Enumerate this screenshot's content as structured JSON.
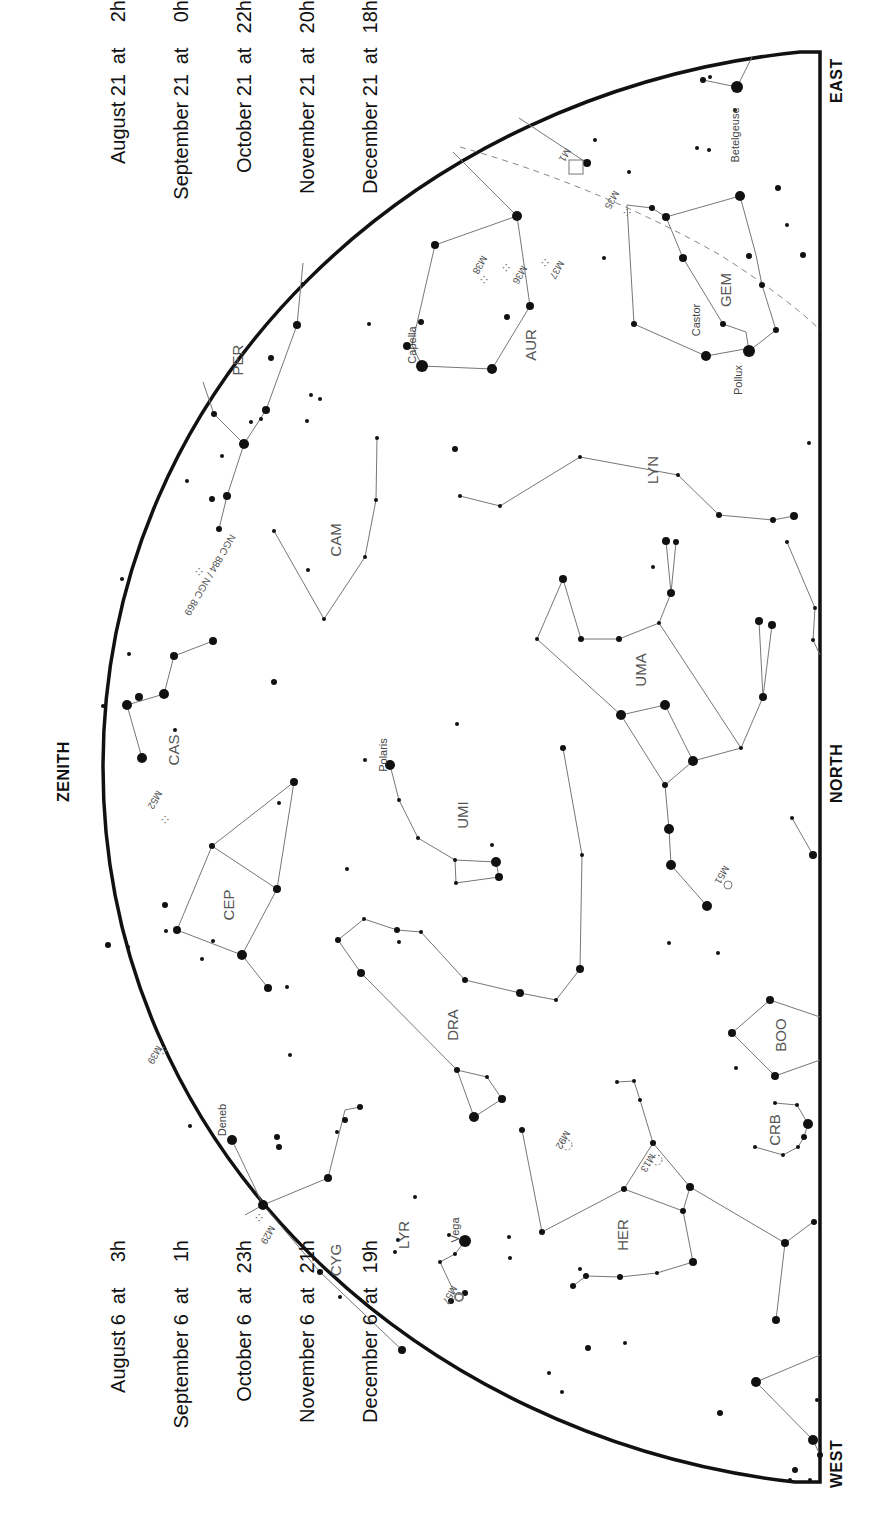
{
  "map": {
    "title_times_top": [
      {
        "date": "August 21",
        "at": "at",
        "hour": "2h"
      },
      {
        "date": "September 21",
        "at": "at",
        "hour": "0h"
      },
      {
        "date": "October 21",
        "at": "at",
        "hour": "22h"
      },
      {
        "date": "November 21",
        "at": "at",
        "hour": "20h"
      },
      {
        "date": "December 21",
        "at": "at",
        "hour": "18h"
      }
    ],
    "title_times_bottom": [
      {
        "date": "August 6",
        "at": "at",
        "hour": "3h"
      },
      {
        "date": "September 6",
        "at": "at",
        "hour": "1h"
      },
      {
        "date": "October 6",
        "at": "at",
        "hour": "23h"
      },
      {
        "date": "November 6",
        "at": "at",
        "hour": "21h"
      },
      {
        "date": "December 6",
        "at": "at",
        "hour": "19h"
      }
    ],
    "directions": {
      "zenith": "ZENITH",
      "north": "NORTH",
      "east": "EAST",
      "west": "WEST"
    },
    "colors": {
      "ink": "#111111",
      "line": "#777777",
      "label": "#555555",
      "ecliptic": "#888888",
      "background": "#ffffff"
    }
  },
  "constellations": [
    {
      "abbr": "PER",
      "x": 237,
      "y": 360
    },
    {
      "abbr": "AUR",
      "x": 530,
      "y": 345
    },
    {
      "abbr": "GEM",
      "x": 725,
      "y": 290
    },
    {
      "abbr": "CAM",
      "x": 335,
      "y": 540
    },
    {
      "abbr": "LYN",
      "x": 652,
      "y": 470
    },
    {
      "abbr": "CAS",
      "x": 173,
      "y": 750
    },
    {
      "abbr": "UMA",
      "x": 640,
      "y": 670
    },
    {
      "abbr": "UMI",
      "x": 462,
      "y": 815
    },
    {
      "abbr": "CEP",
      "x": 228,
      "y": 905
    },
    {
      "abbr": "DRA",
      "x": 452,
      "y": 1025
    },
    {
      "abbr": "BOO",
      "x": 780,
      "y": 1035
    },
    {
      "abbr": "CRB",
      "x": 774,
      "y": 1130
    },
    {
      "abbr": "HER",
      "x": 622,
      "y": 1235
    },
    {
      "abbr": "CYG",
      "x": 335,
      "y": 1260
    },
    {
      "abbr": "LYR",
      "x": 403,
      "y": 1235
    }
  ],
  "star_names": [
    {
      "name": "Betelgeuse",
      "x": 735,
      "y": 135
    },
    {
      "name": "Capella",
      "x": 412,
      "y": 345
    },
    {
      "name": "Castor",
      "x": 696,
      "y": 320
    },
    {
      "name": "Pollux",
      "x": 738,
      "y": 380
    },
    {
      "name": "Polaris",
      "x": 383,
      "y": 755
    },
    {
      "name": "Deneb",
      "x": 222,
      "y": 1120
    },
    {
      "name": "Vega",
      "x": 455,
      "y": 1230
    }
  ],
  "deep_sky_objects": [
    {
      "name": "M1",
      "x": 565,
      "y": 155,
      "type": "nebula"
    },
    {
      "name": "M35",
      "x": 612,
      "y": 200,
      "type": "open-cluster"
    },
    {
      "name": "M36",
      "x": 520,
      "y": 275,
      "type": "open-cluster"
    },
    {
      "name": "M37",
      "x": 557,
      "y": 270,
      "type": "open-cluster"
    },
    {
      "name": "M38",
      "x": 480,
      "y": 265,
      "type": "open-cluster"
    },
    {
      "name": "NGC 884 / NGC 869",
      "x": 210,
      "y": 575,
      "type": "open-cluster"
    },
    {
      "name": "M52",
      "x": 155,
      "y": 800,
      "type": "open-cluster"
    },
    {
      "name": "M51",
      "x": 722,
      "y": 875,
      "type": "galaxy"
    },
    {
      "name": "M39",
      "x": 155,
      "y": 1055,
      "type": "open-cluster"
    },
    {
      "name": "M92",
      "x": 563,
      "y": 1140,
      "type": "globular-cluster"
    },
    {
      "name": "M13",
      "x": 648,
      "y": 1163,
      "type": "globular-cluster"
    },
    {
      "name": "M29",
      "x": 268,
      "y": 1235,
      "type": "open-cluster"
    },
    {
      "name": "M57",
      "x": 450,
      "y": 1295,
      "type": "planetary-nebula"
    }
  ]
}
